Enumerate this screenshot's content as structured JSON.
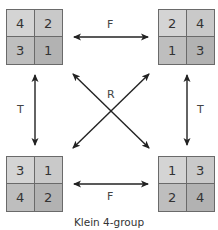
{
  "title": "Klein 4-group",
  "squares": [
    {
      "id": "top-left",
      "cells": [
        "4",
        "2",
        "3",
        "1"
      ],
      "shades": [
        "#d2d2d2",
        "#c8c8c8",
        "#bdbdbd",
        "#b0b0b0"
      ]
    },
    {
      "id": "top-right",
      "cells": [
        "2",
        "4",
        "1",
        "3"
      ],
      "shades": [
        "#d2d2d2",
        "#c8c8c8",
        "#bdbdbd",
        "#b0b0b0"
      ]
    },
    {
      "id": "bottom-left",
      "cells": [
        "3",
        "1",
        "4",
        "2"
      ],
      "shades": [
        "#d2d2d2",
        "#c8c8c8",
        "#bdbdbd",
        "#b0b0b0"
      ]
    },
    {
      "id": "bottom-right",
      "cells": [
        "1",
        "3",
        "2",
        "4"
      ],
      "shades": [
        "#d2d2d2",
        "#c8c8c8",
        "#bdbdbd",
        "#b0b0b0"
      ]
    }
  ],
  "labels": {
    "top_F": "F",
    "bottom_F": "F",
    "left_T": "T",
    "right_T": "T",
    "center_R": "R"
  },
  "colors": {
    "line": "#222222",
    "border": "#6a6a6a"
  }
}
